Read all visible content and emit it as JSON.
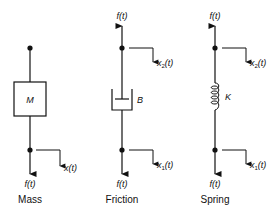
{
  "diagram": {
    "elements": [
      {
        "id": "mass",
        "caption": "Mass",
        "parameter": "M",
        "force_top": "",
        "force_bottom": "f(t)",
        "displacement_top": "",
        "displacement_bottom": "x(t)"
      },
      {
        "id": "friction",
        "caption": "Friction",
        "parameter": "B",
        "force_top": "f(t)",
        "force_bottom": "f(t)",
        "displacement_top": "x2(t)",
        "displacement_bottom": "x1(t)"
      },
      {
        "id": "spring",
        "caption": "Spring",
        "parameter": "K",
        "force_top": "f(t)",
        "force_bottom": "f(t)",
        "displacement_top": "x2(t)",
        "displacement_bottom": "x1(t)"
      }
    ],
    "labels": {
      "f": "f",
      "t": "t",
      "x": "x",
      "sub1": "1",
      "sub2": "2",
      "open": "(",
      "close": ")"
    }
  }
}
